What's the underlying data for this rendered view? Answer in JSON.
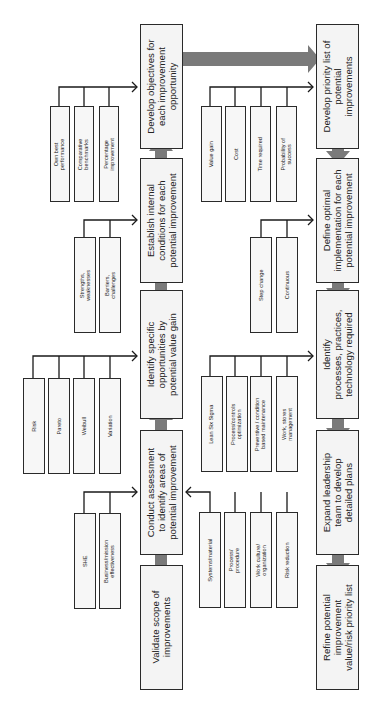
{
  "diagram": {
    "orientation": "rotated-90-ccw",
    "colors": {
      "box_border": "#2a2a2a",
      "box_fill": "#f4f4f4",
      "big_arrow": "#7a7a7a",
      "connector": "#1a1a1a"
    },
    "center_column": [
      {
        "id": "validate",
        "label": "Validate scope of\nimprovements"
      },
      {
        "id": "conduct",
        "label": "Conduct assessment\nto identify areas of\npotential improvement"
      },
      {
        "id": "identify_opps",
        "label": "Identify specific\nopportunities by\npotential value gain"
      },
      {
        "id": "establish",
        "label": "Establish internal\nconditions for each\npotential improvement"
      },
      {
        "id": "develop_obj",
        "label": "Develop objectives for\neach improvement\nopportunity"
      }
    ],
    "right_column": [
      {
        "id": "priority",
        "label": "Develop priority list of\npotential\nimprovements"
      },
      {
        "id": "define",
        "label": "Define optimal\nimplementation for each\npotential improvement"
      },
      {
        "id": "processes",
        "label": "Identify\nprocesses, practices,\ntechnology required"
      },
      {
        "id": "expand",
        "label": "Expand leadership\nteam to develop\ndetailed plans"
      },
      {
        "id": "refine",
        "label": "Refine potential\nimprovement\nvalue/risk priority list"
      }
    ],
    "inputs": {
      "develop_obj": [
        "Own best\nperformance",
        "Comparative\nbenchmarks",
        "Percentage\nimprovement"
      ],
      "establish": [
        "Strengths,\nweaknesses",
        "Barriers,\nchallenges"
      ],
      "identify_opps": [
        "Risk",
        "Pareto",
        "Weibull",
        "Variation"
      ],
      "conduct_left": [
        "SHE",
        "Business/mission\neffectiveness"
      ],
      "conduct_right": [
        "Systems/material",
        "Process/\nprocedure",
        "Work culture/\norganization",
        "Risk reduction"
      ],
      "priority": [
        "Value gain",
        "Cost",
        "Time required",
        "Probability of\nsuccess"
      ],
      "define": [
        "Step change",
        "Continuous"
      ],
      "processes": [
        "Lean Six Sigma",
        "Process/controls\noptimization",
        "Preventive / condition\nbased maintenance",
        "Work, stores\nmanagement"
      ]
    }
  }
}
